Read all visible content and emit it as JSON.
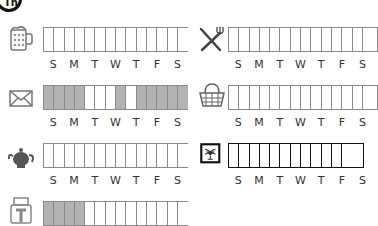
{
  "header": {
    "icon": "circled-th-icon",
    "icon_text": "Th"
  },
  "day_labels": [
    "S",
    "M",
    "T",
    "W",
    "T",
    "F",
    "S"
  ],
  "colors": {
    "grid_border": "#8a8a8a",
    "filled_cell": "#b3b3b3",
    "dark_border": "#111111"
  },
  "trackers": [
    {
      "id": "beer",
      "icon": "beer-mug-icon",
      "cells": [
        0,
        0,
        0,
        0,
        0,
        0,
        0,
        0,
        0,
        0,
        0,
        0,
        0,
        0
      ]
    },
    {
      "id": "dining",
      "icon": "fork-knife-icon",
      "cells": [
        0,
        0,
        0,
        0,
        0,
        0,
        0,
        0,
        0,
        0,
        0,
        0,
        0,
        0
      ]
    },
    {
      "id": "mail",
      "icon": "envelope-icon",
      "cells": [
        1,
        1,
        1,
        1,
        0,
        0,
        0,
        1,
        0,
        1,
        1,
        1,
        1,
        1
      ]
    },
    {
      "id": "shopping",
      "icon": "basket-icon",
      "cells": [
        0,
        0,
        0,
        0,
        0,
        0,
        0,
        0,
        0,
        0,
        0,
        0,
        0,
        0
      ]
    },
    {
      "id": "tea",
      "icon": "teapot-icon",
      "cells": [
        0,
        0,
        0,
        0,
        0,
        0,
        0,
        0,
        0,
        0,
        0,
        0,
        0,
        0
      ]
    },
    {
      "id": "bar",
      "icon": "cocktail-icon",
      "cells": [
        0,
        0,
        0,
        0,
        0,
        0,
        0,
        0,
        0,
        0,
        0,
        0
      ],
      "dark": true
    },
    {
      "id": "printer",
      "icon": "printer-icon",
      "cells": [
        1,
        1,
        1,
        1,
        0,
        0,
        0,
        0,
        0,
        0,
        0,
        0,
        0,
        0
      ]
    }
  ]
}
